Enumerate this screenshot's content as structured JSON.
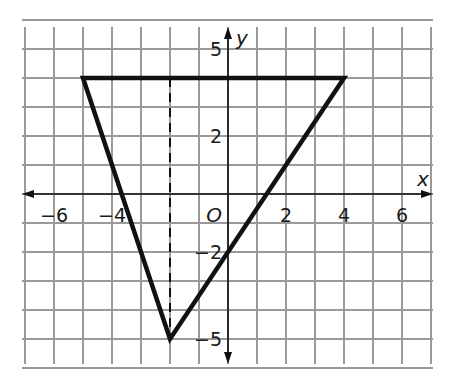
{
  "figure": {
    "type": "coordinate-plane",
    "grid": {
      "x_range": [
        -7,
        7
      ],
      "y_range": [
        -6,
        6
      ],
      "unit_px": 29,
      "origin_px": [
        228,
        194
      ],
      "line_color": "#9a9a9a",
      "left_px": 22,
      "top_px": 27,
      "right_px": 433,
      "bottom_px": 364
    },
    "axes": {
      "x_label": "x",
      "y_label": "y",
      "origin_label": "O",
      "x_ticks": [
        {
          "value": -6,
          "label": "−6"
        },
        {
          "value": -4,
          "label": "−4"
        },
        {
          "value": 2,
          "label": "2"
        },
        {
          "value": 4,
          "label": "4"
        },
        {
          "value": 6,
          "label": "6"
        }
      ],
      "y_ticks": [
        {
          "value": 5,
          "label": "5"
        },
        {
          "value": 2,
          "label": "2"
        },
        {
          "value": -2,
          "label": "−2"
        },
        {
          "value": -5,
          "label": "−5"
        }
      ]
    },
    "triangle": {
      "vertices": [
        [
          -5,
          4
        ],
        [
          4,
          4
        ],
        [
          -2,
          -5
        ]
      ],
      "stroke": "#111111"
    },
    "dashed_segment": {
      "from": [
        -2,
        4
      ],
      "to": [
        -2,
        -5
      ]
    }
  }
}
